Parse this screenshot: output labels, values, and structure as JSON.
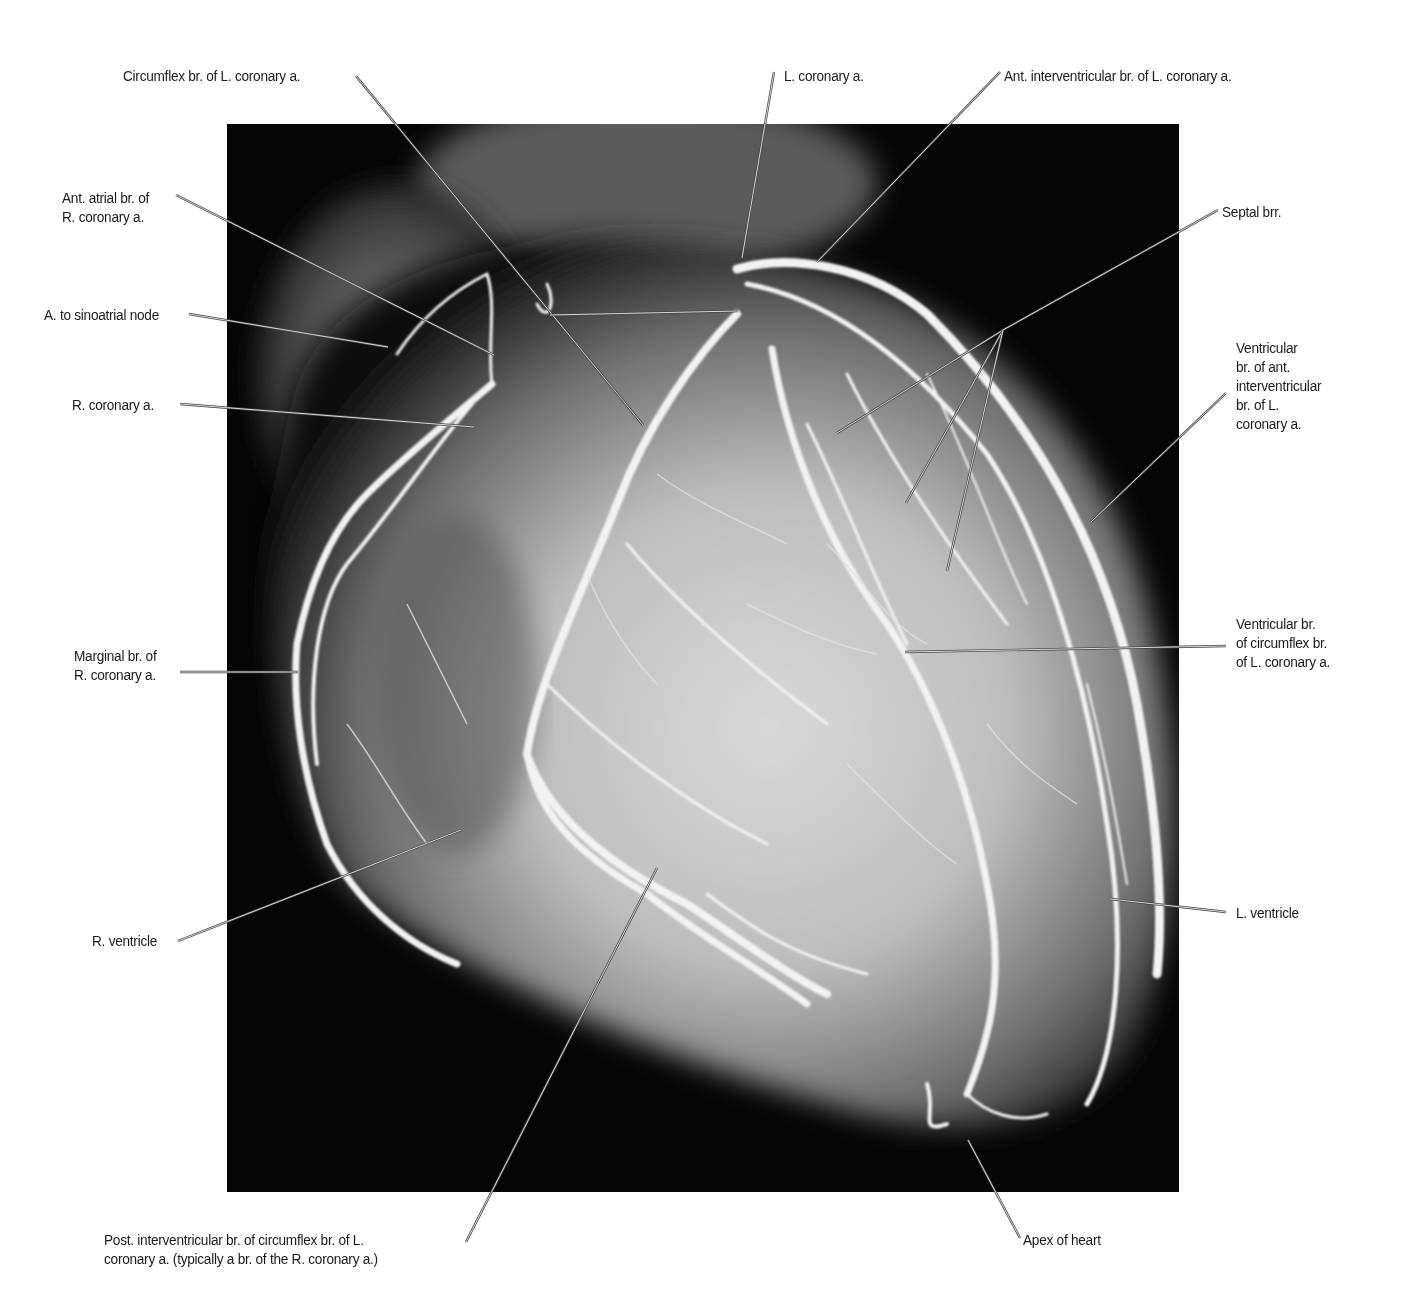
{
  "figure": {
    "background": "#050505",
    "frame": {
      "x": 227,
      "y": 124,
      "width": 952,
      "height": 1068
    }
  },
  "labels": [
    {
      "id": "circumflex",
      "lines": [
        "Circumflex br. of L. coronary a."
      ],
      "x": 123,
      "y": 66,
      "align": "left",
      "leader": [
        [
          356,
          76
        ],
        [
          643,
          425
        ]
      ]
    },
    {
      "id": "l-coronary",
      "lines": [
        "L. coronary a."
      ],
      "x": 784,
      "y": 66,
      "align": "left",
      "leader": [
        [
          774,
          72
        ],
        [
          742,
          258
        ]
      ]
    },
    {
      "id": "ant-interventricular",
      "lines": [
        "Ant. interventricular br. of L. coronary a."
      ],
      "x": 1004,
      "y": 66,
      "align": "left",
      "leader": [
        [
          1000,
          72
        ],
        [
          817,
          262
        ]
      ]
    },
    {
      "id": "septal",
      "lines": [
        "Septal brr."
      ],
      "x": 1222,
      "y": 202,
      "align": "left",
      "leader": [
        [
          1218,
          210
        ],
        [
          1003,
          330
        ]
      ],
      "extra_leaders": [
        [
          [
            1003,
            330
          ],
          [
            837,
            433
          ]
        ],
        [
          [
            1003,
            330
          ],
          [
            906,
            503
          ]
        ],
        [
          [
            1003,
            330
          ],
          [
            947,
            571
          ]
        ]
      ]
    },
    {
      "id": "ant-atrial",
      "lines": [
        "Ant. atrial br. of",
        "R. coronary a."
      ],
      "x": 62,
      "y": 190,
      "align": "left",
      "leader": [
        [
          176,
          195
        ],
        [
          494,
          355
        ]
      ]
    },
    {
      "id": "sinoatrial",
      "lines": [
        "A. to sinoatrial node"
      ],
      "x": 44,
      "y": 306,
      "align": "left",
      "leader": [
        [
          189,
          314
        ],
        [
          388,
          347
        ]
      ],
      "extra_leaders": [
        [
          [
            550,
            315
          ],
          [
            738,
            311
          ]
        ]
      ]
    },
    {
      "id": "r-coronary",
      "lines": [
        "R. coronary a."
      ],
      "x": 72,
      "y": 397,
      "align": "left",
      "leader": [
        [
          180,
          404
        ],
        [
          474,
          427
        ]
      ]
    },
    {
      "id": "ventricular-ant-interventricular",
      "lines": [
        "Ventricular",
        "br. of ant.",
        "interventricular",
        "br. of L.",
        "coronary a."
      ],
      "x": 1236,
      "y": 340,
      "align": "left",
      "leader": [
        [
          1226,
          393
        ],
        [
          1091,
          522
        ]
      ]
    },
    {
      "id": "marginal",
      "lines": [
        "Marginal br. of",
        "R. coronary a."
      ],
      "x": 74,
      "y": 648,
      "align": "left",
      "leader": [
        [
          180,
          672
        ],
        [
          298,
          672
        ]
      ]
    },
    {
      "id": "ventricular-circumflex",
      "lines": [
        "Ventricular br.",
        "of circumflex br.",
        "of L. coronary a."
      ],
      "x": 1236,
      "y": 616,
      "align": "left",
      "leader": [
        [
          1226,
          646
        ],
        [
          905,
          652
        ]
      ]
    },
    {
      "id": "r-ventricle",
      "lines": [
        "R. ventricle"
      ],
      "x": 92,
      "y": 933,
      "align": "left",
      "leader": [
        [
          178,
          941
        ],
        [
          461,
          830
        ]
      ]
    },
    {
      "id": "l-ventricle",
      "lines": [
        "L. ventricle"
      ],
      "x": 1236,
      "y": 904,
      "align": "left",
      "leader": [
        [
          1226,
          912
        ],
        [
          1110,
          899
        ]
      ]
    },
    {
      "id": "post-interventricular",
      "lines": [
        "Post. interventricular br. of circumflex br. of L.",
        "coronary a. (typically a br. of the R. coronary a.)"
      ],
      "x": 104,
      "y": 1232,
      "align": "left",
      "leader": [
        [
          466,
          1242
        ],
        [
          657,
          868
        ]
      ]
    },
    {
      "id": "apex",
      "lines": [
        "Apex of heart"
      ],
      "x": 1023,
      "y": 1232,
      "align": "left",
      "leader": [
        [
          1020,
          1238
        ],
        [
          968,
          1140
        ]
      ]
    }
  ]
}
